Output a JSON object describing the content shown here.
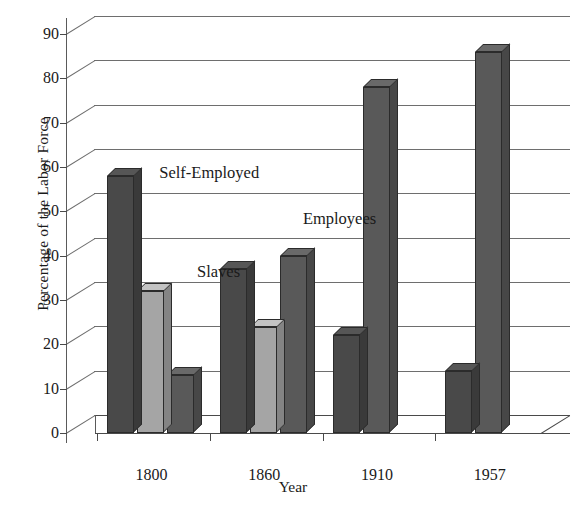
{
  "chart_data": {
    "type": "bar",
    "title": "",
    "xlabel": "Year",
    "ylabel": "Percentage of the Labor Force",
    "categories": [
      "1800",
      "1860",
      "1910",
      "1957"
    ],
    "ylim": [
      0,
      90
    ],
    "ytick_labels": [
      "0",
      "10",
      "20",
      "30",
      "40",
      "50",
      "60",
      "70",
      "80",
      "90"
    ],
    "ytick_values": [
      0,
      10,
      20,
      30,
      40,
      50,
      60,
      70,
      80,
      90
    ],
    "grid": true,
    "legend_position": "inline-annotations",
    "series": [
      {
        "name": "Self-Employed",
        "color": "#494949",
        "values": [
          58,
          37,
          22,
          14
        ]
      },
      {
        "name": "Slaves",
        "color": "#a5a5a5",
        "values": [
          32,
          24,
          0,
          0
        ]
      },
      {
        "name": "Employees",
        "color": "#595959",
        "values": [
          13,
          40,
          78,
          86
        ]
      }
    ],
    "annotations": [
      {
        "text": "Self-Employed",
        "x_pct": 18.5,
        "y_pct": 34.0
      },
      {
        "text": "Slaves",
        "x_pct": 26.0,
        "y_pct": 57.5
      },
      {
        "text": "Employees",
        "x_pct": 47.0,
        "y_pct": 45.0
      }
    ]
  }
}
